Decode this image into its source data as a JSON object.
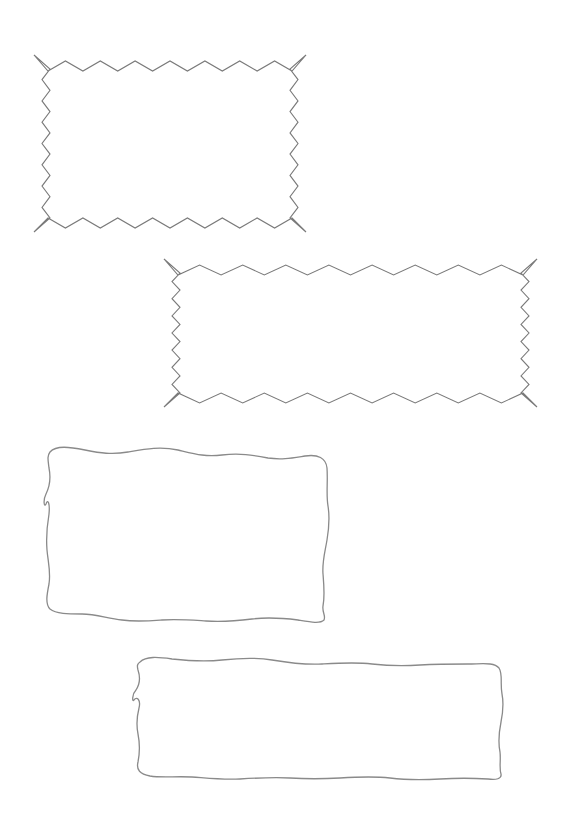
{
  "page": {
    "background": "#ffffff",
    "stroke_color": "#7a7a7a"
  },
  "frames": [
    {
      "id": "zigzag-frame-1",
      "style": "zigzag",
      "bbox": [
        34,
        55,
        306,
        232
      ],
      "top_teeth": 7,
      "side_teeth": 7
    },
    {
      "id": "zigzag-frame-2",
      "style": "zigzag",
      "bbox": [
        164,
        259,
        537,
        407
      ],
      "top_teeth": 7,
      "side_teeth": 7
    },
    {
      "id": "wavy-frame-1",
      "style": "wavy",
      "bbox": [
        45,
        447,
        330,
        622
      ]
    },
    {
      "id": "wavy-frame-2",
      "style": "wavy",
      "bbox": [
        133,
        657,
        502,
        780
      ]
    }
  ]
}
